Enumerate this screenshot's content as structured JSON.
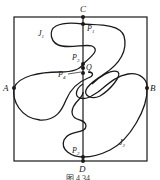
{
  "figure": {
    "caption": "图 4.34",
    "labels": {
      "C": "C",
      "D": "D",
      "A": "A",
      "B": "B",
      "J1": "J",
      "J1_sub": "1",
      "J2": "J",
      "J2_sub": "2",
      "P1": "P",
      "P1_sub": "1",
      "P2": "P",
      "P2_sub": "2",
      "P3": "P",
      "P3_sub": "3",
      "P4": "P",
      "P4_sub": "4",
      "Q": "Q"
    },
    "colors": {
      "stroke": "#1a1a1a",
      "background": "#ffffff"
    }
  }
}
